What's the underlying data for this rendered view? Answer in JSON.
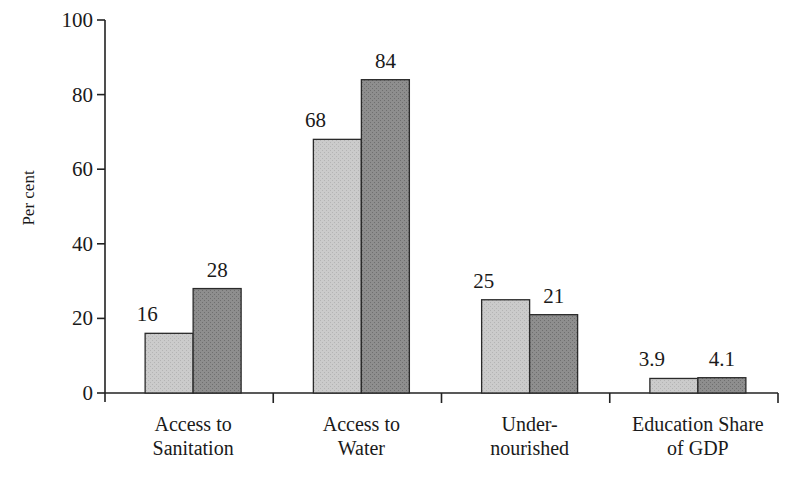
{
  "chart_data": {
    "type": "bar",
    "title": "",
    "xlabel": "",
    "ylabel": "Per cent",
    "ylim": [
      0,
      100
    ],
    "yticks": [
      0,
      20,
      40,
      60,
      80,
      100
    ],
    "grid": false,
    "legend": null,
    "categories": [
      [
        "Access to",
        "Sanitation"
      ],
      [
        "Access to",
        "Water"
      ],
      [
        "Under-",
        "nourished"
      ],
      [
        "Education Share",
        "of GDP"
      ]
    ],
    "series": [
      {
        "name": "Series 1 (light)",
        "color": "#c9c9c9",
        "values": [
          16,
          68,
          25,
          3.9
        ],
        "labels": [
          "16",
          "68",
          "25",
          "3.9"
        ]
      },
      {
        "name": "Series 2 (dark)",
        "color": "#8c8c8c",
        "values": [
          28,
          84,
          21,
          4.1
        ],
        "labels": [
          "28",
          "84",
          "21",
          "4.1"
        ]
      }
    ]
  }
}
